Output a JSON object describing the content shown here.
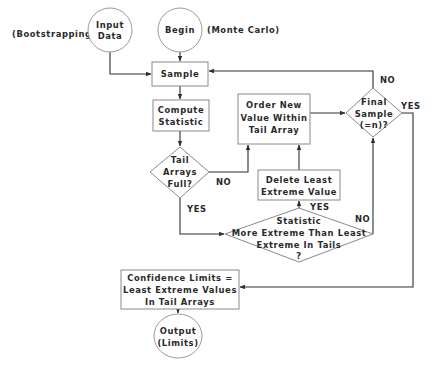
{
  "diagram": {
    "type": "flowchart",
    "annotations": {
      "bootstrapping": "(Bootstrapping)",
      "monte_carlo": "(Monte Carlo)"
    },
    "nodes": {
      "input_data": {
        "shape": "circle",
        "lines": [
          "Input",
          "Data"
        ]
      },
      "begin": {
        "shape": "circle",
        "lines": [
          "Begin"
        ]
      },
      "sample": {
        "shape": "rectangle",
        "lines": [
          "Sample"
        ]
      },
      "compute_statistic": {
        "shape": "rectangle",
        "lines": [
          "Compute",
          "Statistic"
        ]
      },
      "tail_arrays_full": {
        "shape": "diamond",
        "lines": [
          "Tail",
          "Arrays",
          "Full?"
        ]
      },
      "order_new_value": {
        "shape": "rectangle",
        "lines": [
          "Order New",
          "Value Within",
          "Tail Array"
        ]
      },
      "final_sample": {
        "shape": "diamond",
        "lines": [
          "Final",
          "Sample",
          "(=n)?"
        ]
      },
      "delete_least_extreme": {
        "shape": "rectangle",
        "lines": [
          "Delete Least",
          "Extreme Value"
        ]
      },
      "statistic_more_extreme": {
        "shape": "diamond",
        "lines": [
          "Statistic",
          "More Extreme Than Least",
          "Extreme In Tails",
          "?"
        ]
      },
      "confidence_limits": {
        "shape": "rectangle",
        "lines": [
          "Confidence Limits =",
          "Least Extreme Values",
          "In Tail Arrays"
        ]
      },
      "output": {
        "shape": "circle",
        "lines": [
          "Output",
          "(Limits)"
        ]
      }
    },
    "edge_labels": {
      "tail_full_no": "NO",
      "tail_full_yes": "YES",
      "final_no": "NO",
      "final_yes": "YES",
      "more_extreme_yes": "YES",
      "more_extreme_no": "NO"
    },
    "edges": [
      {
        "from": "input_data",
        "to": "sample",
        "label": ""
      },
      {
        "from": "begin",
        "to": "sample",
        "label": ""
      },
      {
        "from": "sample",
        "to": "compute_statistic",
        "label": ""
      },
      {
        "from": "compute_statistic",
        "to": "tail_arrays_full",
        "label": ""
      },
      {
        "from": "tail_arrays_full",
        "to": "order_new_value",
        "label": "NO"
      },
      {
        "from": "tail_arrays_full",
        "to": "statistic_more_extreme",
        "label": "YES"
      },
      {
        "from": "statistic_more_extreme",
        "to": "delete_least_extreme",
        "label": "YES"
      },
      {
        "from": "statistic_more_extreme",
        "to": "final_sample",
        "label": "NO"
      },
      {
        "from": "delete_least_extreme",
        "to": "order_new_value",
        "label": ""
      },
      {
        "from": "order_new_value",
        "to": "final_sample",
        "label": ""
      },
      {
        "from": "final_sample",
        "to": "sample",
        "label": "NO"
      },
      {
        "from": "final_sample",
        "to": "confidence_limits",
        "label": "YES"
      },
      {
        "from": "confidence_limits",
        "to": "output",
        "label": ""
      }
    ]
  }
}
